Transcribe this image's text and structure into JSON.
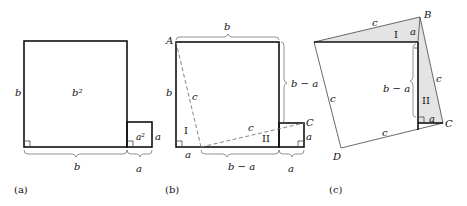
{
  "panels": [
    {
      "id": "a",
      "caption": "(a)",
      "labels": {
        "big_square_area": "b²",
        "small_square_area": "a²",
        "big_side": "b",
        "small_side": "a",
        "bottom_big": "b",
        "bottom_small": "a"
      }
    },
    {
      "id": "b",
      "caption": "(b)",
      "labels": {
        "vertex_A": "A",
        "vertex_C": "C",
        "top_brace": "b",
        "right_brace": "b − a",
        "left_side": "b",
        "hyp_left": "c",
        "hyp_right": "c",
        "triangle_I": "I",
        "triangle_II": "II",
        "small_side": "a",
        "bottom_a": "a",
        "bottom_mid": "b − a",
        "bottom_right": "a"
      }
    },
    {
      "id": "c",
      "caption": "(c)",
      "labels": {
        "vertex_A": "A",
        "vertex_B": "B",
        "vertex_C": "C",
        "vertex_D": "D",
        "side_AB": "c",
        "side_BC": "c",
        "side_CD": "c",
        "side_DA": "c",
        "triangle_I": "I",
        "triangle_II": "II",
        "leg_a_top": "a",
        "leg_a_bottom": "a",
        "inner_brace": "b − a"
      }
    }
  ],
  "colors": {
    "shaded_triangle": "#e4e4e4",
    "line": "#111111"
  }
}
